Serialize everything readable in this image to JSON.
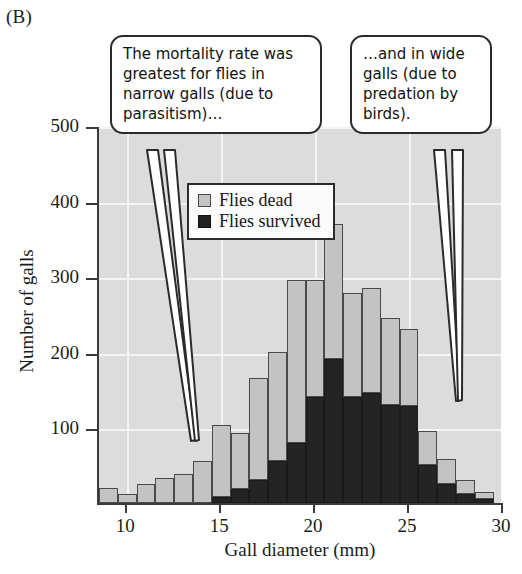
{
  "panel": {
    "label": "(B)"
  },
  "chart_data": {
    "type": "bar",
    "subtype": "stacked-histogram",
    "title": "",
    "xlabel": "Gall diameter (mm)",
    "ylabel": "Number of galls",
    "xlim": [
      8.5,
      30.0
    ],
    "ylim": [
      0,
      500
    ],
    "xticks": [
      10,
      15,
      20,
      25,
      30
    ],
    "yticks": [
      100,
      200,
      300,
      400,
      500
    ],
    "grid": true,
    "bin_width": 1,
    "categories": [
      9,
      10,
      11,
      12,
      13,
      14,
      15,
      16,
      17,
      18,
      19,
      20,
      21,
      22,
      23,
      24,
      25,
      26,
      27,
      28,
      29
    ],
    "series": [
      {
        "name": "Flies survived",
        "color": "#242424",
        "values": [
          0,
          0,
          0,
          0,
          0,
          0,
          8,
          18,
          30,
          55,
          80,
          140,
          190,
          140,
          145,
          130,
          128,
          50,
          25,
          12,
          5
        ]
      },
      {
        "name": "Flies dead",
        "color": "#c3c3c3",
        "values": [
          20,
          12,
          25,
          33,
          38,
          55,
          95,
          75,
          135,
          145,
          215,
          155,
          179,
          138,
          140,
          115,
          102,
          45,
          33,
          18,
          9
        ]
      }
    ],
    "totals": [
      20,
      12,
      25,
      33,
      38,
      55,
      103,
      93,
      165,
      200,
      295,
      295,
      369,
      278,
      285,
      245,
      230,
      95,
      58,
      30,
      14
    ],
    "legend": {
      "position": "inside-top-left",
      "entries": [
        {
          "label": "Flies dead",
          "swatch": "light-gray"
        },
        {
          "label": "Flies survived",
          "swatch": "black"
        }
      ]
    }
  },
  "callouts": [
    {
      "id": "left",
      "text": "The mortality rate was greatest for flies in narrow galls (due to parasitism)…"
    },
    {
      "id": "right",
      "text": "…and in wide galls (due to predation by birds)."
    }
  ],
  "colors": {
    "plot_background": "#dcdcdc",
    "gridline": "#f4f4f4",
    "axis": "#3a3a3a",
    "dead": "#c3c3c3",
    "survived": "#242424",
    "page": "#ffffff"
  }
}
